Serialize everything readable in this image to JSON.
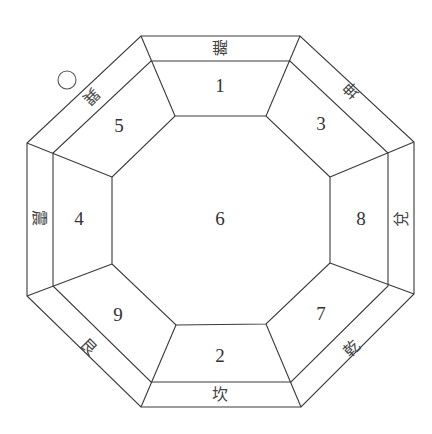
{
  "diagram": {
    "center_number": "6",
    "palaces": [
      {
        "position": "top",
        "number": "1",
        "trigram": "離",
        "trigram_rotation": 180
      },
      {
        "position": "top-right",
        "number": "3",
        "trigram": "坤",
        "trigram_rotation": -135
      },
      {
        "position": "right",
        "number": "8",
        "trigram": "兌",
        "trigram_rotation": -90
      },
      {
        "position": "bottom-right",
        "number": "7",
        "trigram": "乾",
        "trigram_rotation": -45
      },
      {
        "position": "bottom",
        "number": "2",
        "trigram": "坎",
        "trigram_rotation": 0
      },
      {
        "position": "bottom-left",
        "number": "9",
        "trigram": "艮",
        "trigram_rotation": 45
      },
      {
        "position": "left",
        "number": "4",
        "trigram": "震",
        "trigram_rotation": 90
      },
      {
        "position": "top-left",
        "number": "5",
        "trigram": "巽",
        "trigram_rotation": 135
      }
    ],
    "marker": "circle",
    "colors": {
      "line": "#3a3a3a",
      "text": "#333333",
      "background": "#ffffff"
    }
  }
}
